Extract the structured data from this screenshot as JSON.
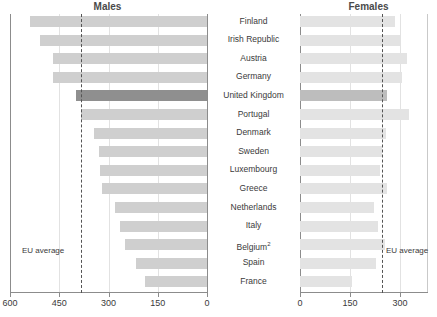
{
  "chart_data": {
    "type": "bar",
    "orientation": "horizontal",
    "title": "",
    "panels": [
      {
        "name": "males",
        "title": "Males",
        "direction": "rtl",
        "xlabel": "",
        "ylabel": "",
        "xlim": [
          600,
          0
        ],
        "ticks": [
          600,
          450,
          300,
          150,
          0
        ],
        "tick_labels": [
          "600",
          "450",
          "300",
          "150",
          "0"
        ],
        "grid": true,
        "reference_line": {
          "label": "EU average",
          "value": 385
        },
        "values": [
          540,
          510,
          470,
          470,
          400,
          385,
          345,
          330,
          325,
          320,
          280,
          265,
          250,
          215,
          190
        ]
      },
      {
        "name": "females",
        "title": "Females",
        "direction": "ltr",
        "xlabel": "",
        "ylabel": "",
        "xlim": [
          0,
          380
        ],
        "ticks": [
          0,
          150,
          300
        ],
        "tick_labels": [
          "0",
          "150",
          "300"
        ],
        "grid": true,
        "reference_line": {
          "label": "EU average",
          "value": 246
        },
        "values": [
          285,
          300,
          320,
          306,
          261,
          327,
          258,
          246,
          240,
          261,
          222,
          234,
          255,
          228,
          156
        ]
      }
    ],
    "categories": [
      "Finland",
      "Irish Republic",
      "Austria",
      "Germany",
      "United Kingdom",
      "Portugal",
      "Denmark",
      "Sweden",
      "Luxembourg",
      "Greece",
      "Netherlands",
      "Italy",
      "Belgium²",
      "Spain",
      "France"
    ],
    "highlight_category": "United Kingdom",
    "colors": {
      "bar_male": "#cfcfcf",
      "bar_male_highlight": "#8f8f8f",
      "bar_female": "#e3e3e3",
      "bar_female_highlight": "#bdbdbd",
      "axis": "#8c8c8c",
      "grid": "#e2e2e2",
      "reference": "#545454",
      "text": "#3a3a3a"
    }
  }
}
